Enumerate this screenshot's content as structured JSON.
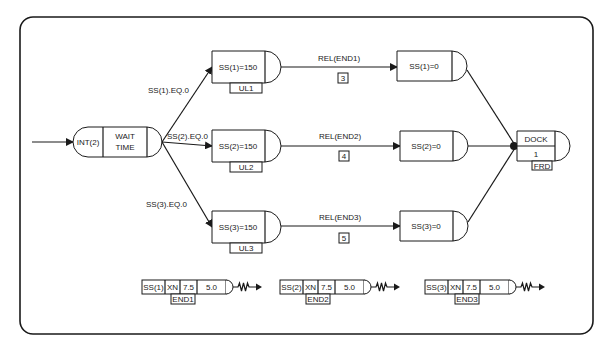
{
  "diagram": {
    "type": "SLAM network diagram",
    "start_node": {
      "left": "INT(2)",
      "right_line1": "WAIT",
      "right_line2": "TIME"
    },
    "branches": [
      {
        "condition": "SS(1).EQ.0",
        "assign": "SS(1)=150",
        "tag": "UL1",
        "activity_label": "REL(END1)",
        "activity_number": "3",
        "reset": "SS(1)=0"
      },
      {
        "condition": "SS(2).EQ.0",
        "assign": "SS(2)=150",
        "tag": "UL2",
        "activity_label": "REL(END2)",
        "activity_number": "4",
        "reset": "SS(2)=0"
      },
      {
        "condition": "SS(3).EQ.0",
        "assign": "SS(3)=150",
        "tag": "UL3",
        "activity_label": "REL(END3)",
        "activity_number": "5",
        "reset": "SS(3)=0"
      }
    ],
    "end_node": {
      "top": "DOCK",
      "bottom": "1",
      "tag": "FRD"
    },
    "detect_nodes": [
      {
        "var": "SS(1)",
        "cond": "XN",
        "threshold": "7.5",
        "tol": "5.0",
        "tag": "END1"
      },
      {
        "var": "SS(2)",
        "cond": "XN",
        "threshold": "7.5",
        "tol": "5.0",
        "tag": "END2"
      },
      {
        "var": "SS(3)",
        "cond": "XN",
        "threshold": "7.5",
        "tol": "5.0",
        "tag": "END3"
      }
    ]
  }
}
